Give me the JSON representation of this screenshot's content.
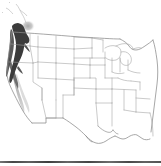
{
  "figure": {
    "type": "range-map",
    "region_label": "Contiguous United States",
    "caption": "",
    "width_px": 161,
    "height_px": 166
  },
  "colors": {
    "background": "#ffffff",
    "state_border": "#9a9a9a",
    "coastline": "#7d7d7d",
    "national_border": "#8a8a8a",
    "range_core": "#3a3a3a",
    "range_mid": "#6e6e6e",
    "range_light": "#c8c8c8",
    "range_patch": "#bdbdbd",
    "bottom_rule": "#4a4a4a"
  },
  "legend": {
    "visible": false,
    "entries": [
      {
        "label": "Core range",
        "color": "#3a3a3a"
      },
      {
        "label": "Secondary range",
        "color": "#c8c8c8"
      }
    ]
  },
  "range_overlay": {
    "description": "Dark shaded band along the Pacific coast of Washington, Oregon and northern California, fading to light gray southward along the California Sierra Nevada; a small faint gray patch in northern Washington.",
    "features": [
      {
        "name": "pacific-coast-core-band",
        "shade": "dark",
        "color": "#3a3a3a"
      },
      {
        "name": "northern-california-band",
        "shade": "mid",
        "color": "#6e6e6e"
      },
      {
        "name": "sierra-nevada-tail",
        "shade": "light",
        "color": "#c8c8c8"
      },
      {
        "name": "north-washington-patch",
        "shade": "light",
        "color": "#bdbdbd"
      }
    ]
  },
  "axes": {
    "visible": false,
    "tick_labels": []
  },
  "annotations": []
}
